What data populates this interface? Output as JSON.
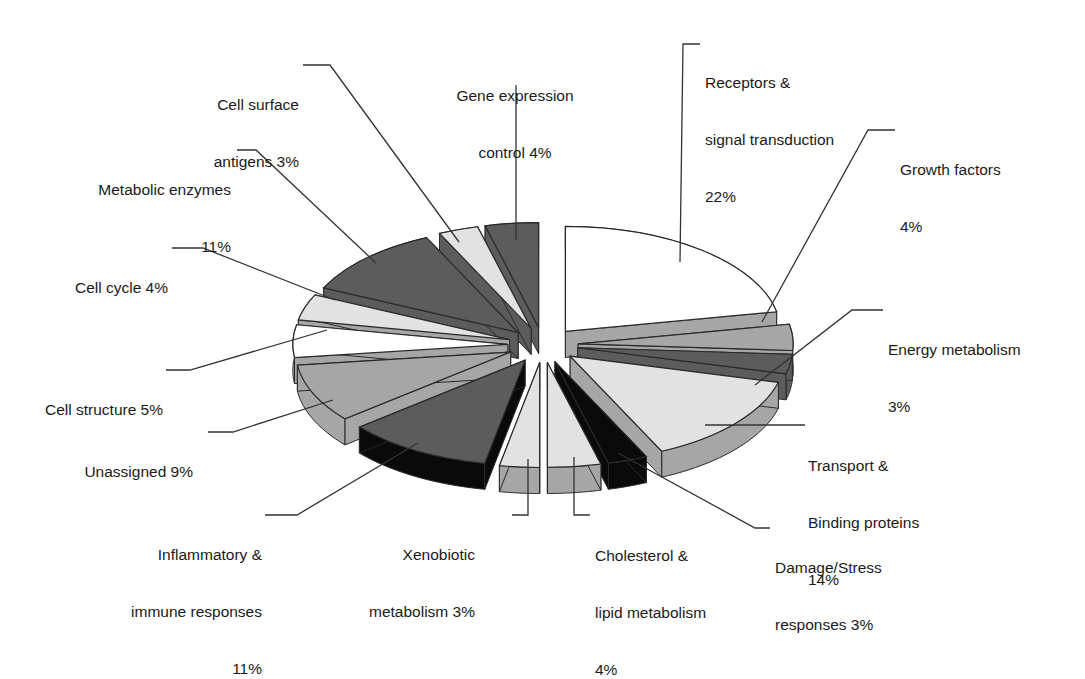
{
  "chart_data": {
    "type": "pie",
    "style": "3d-exploded",
    "title": "",
    "unit": "%",
    "categories": [
      "Receptors & signal transduction",
      "Growth factors",
      "Energy metabolism",
      "Transport & Binding proteins",
      "Damage/Stress responses",
      "Cholesterol & lipid metabolism",
      "Xenobiotic metabolism",
      "Inflammatory & immune responses",
      "Unassigned",
      "Cell structure",
      "Cell cycle",
      "Metabolic enzymes",
      "Cell surface antigens",
      "Gene expression control"
    ],
    "values": [
      22,
      4,
      3,
      14,
      3,
      4,
      3,
      11,
      9,
      5,
      4,
      11,
      3,
      4
    ],
    "legend": "none (callout labels)"
  },
  "labels": {
    "receptors": {
      "line1": "Receptors &",
      "line2": "signal transduction",
      "line3": "22%"
    },
    "growth": {
      "line1": "Growth factors",
      "line2": "4%"
    },
    "energy": {
      "line1": "Energy metabolism",
      "line2": "3%"
    },
    "transport": {
      "line1": "Transport &",
      "line2": "Binding proteins",
      "line3": "14%"
    },
    "damage": {
      "line1": "Damage/Stress",
      "line2": "responses 3%"
    },
    "cholesterol": {
      "line1": "Cholesterol &",
      "line2": "lipid metabolism",
      "line3": "4%"
    },
    "xenobiotic": {
      "line1": "Xenobiotic",
      "line2": "metabolism 3%"
    },
    "inflammatory": {
      "line1": "Inflammatory &",
      "line2": "immune responses",
      "line3": "11%"
    },
    "unassigned": {
      "line1": "Unassigned 9%"
    },
    "structure": {
      "line1": "Cell structure 5%"
    },
    "cycle": {
      "line1": "Cell cycle 4%"
    },
    "metabolic": {
      "line1": "Metabolic enzymes",
      "line2": "11%"
    },
    "surface": {
      "line1": "Cell surface",
      "line2": "antigens 3%"
    },
    "gene": {
      "line1": "Gene expression",
      "line2": "control 4%"
    }
  },
  "colors": {
    "white": "#ffffff",
    "light": "#e2e2e2",
    "mid": "#a6a6a6",
    "dark": "#5c5c5c",
    "black": "#0a0a0a",
    "outline": "#2a2a2a"
  }
}
